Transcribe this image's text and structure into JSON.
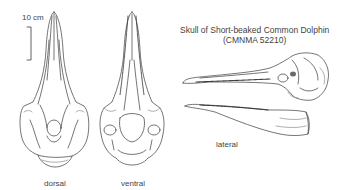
{
  "title": {
    "line1": "Skull of Short-beaked Common Dolphin",
    "line2": "(CMNMA 52210)"
  },
  "scale_bar": {
    "label": "10 cm"
  },
  "views": [
    {
      "id": "dorsal",
      "label": "dorsal"
    },
    {
      "id": "ventral",
      "label": "ventral"
    },
    {
      "id": "lateral",
      "label": "lateral"
    }
  ],
  "colors": {
    "ink": "#3a3a3a",
    "shade": "#9a9a9a",
    "background": "#ffffff"
  }
}
